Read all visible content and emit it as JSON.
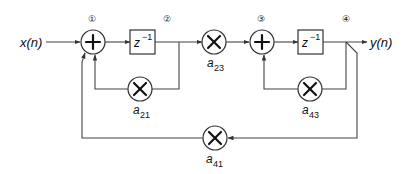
{
  "diagram": {
    "type": "signal-flow-block-diagram",
    "input_label": "x(n)",
    "output_label": "y(n)",
    "nodes": [
      {
        "id": "1",
        "marker": "①",
        "kind": "adder"
      },
      {
        "id": "2",
        "marker": "②",
        "kind": "branch"
      },
      {
        "id": "3",
        "marker": "③",
        "kind": "adder"
      },
      {
        "id": "4",
        "marker": "④",
        "kind": "branch"
      }
    ],
    "delays": [
      {
        "id": "delay1",
        "label_base": "z",
        "label_exp": "−1"
      },
      {
        "id": "delay2",
        "label_base": "z",
        "label_exp": "−1"
      }
    ],
    "multipliers": [
      {
        "id": "a21",
        "base": "a",
        "sub": "21"
      },
      {
        "id": "a23",
        "base": "a",
        "sub": "23"
      },
      {
        "id": "a43",
        "base": "a",
        "sub": "43"
      },
      {
        "id": "a41",
        "base": "a",
        "sub": "41"
      }
    ],
    "colors": {
      "line": "#444444",
      "symbol": "#111111",
      "background": "#ffffff"
    }
  }
}
